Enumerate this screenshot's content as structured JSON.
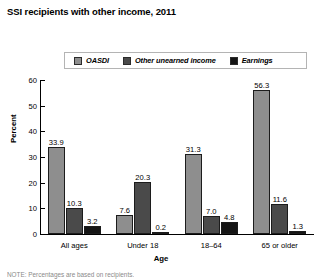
{
  "chart_data": {
    "type": "bar",
    "title": "SSI recipients with other income, 2011",
    "xlabel": "Age",
    "ylabel": "Percent",
    "ylim": [
      0,
      60
    ],
    "yticks": [
      0,
      10,
      20,
      30,
      40,
      50,
      60
    ],
    "ytick_labels": [
      "0",
      "10",
      "20",
      "30",
      "40",
      "50",
      "60"
    ],
    "grid": false,
    "legend_position": "top",
    "categories": [
      "All ages",
      "Under 18",
      "18–64",
      "65 or older"
    ],
    "series": [
      {
        "name": "OASDI",
        "color": "#8e8e8e",
        "values": [
          33.9,
          7.6,
          31.3,
          56.3
        ],
        "labels": [
          "33.9",
          "7.6",
          "31.3",
          "56.3"
        ]
      },
      {
        "name": "Other unearned income",
        "color": "#4a4a4a",
        "values": [
          10.3,
          20.3,
          7.0,
          11.6
        ],
        "labels": [
          "10.3",
          "20.3",
          "7.0",
          "11.6"
        ]
      },
      {
        "name": "Earnings",
        "color": "#151515",
        "values": [
          3.2,
          0.2,
          4.8,
          1.3
        ],
        "labels": [
          "3.2",
          "0.2",
          "4.8",
          "1.3"
        ]
      }
    ]
  },
  "footnote": {
    "text": "NOTE: Percentages are based on recipients."
  }
}
